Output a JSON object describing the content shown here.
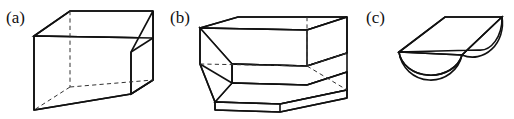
{
  "figure": {
    "background_color": "#ffffff",
    "line_color": "#111111",
    "hidden_line_color": "#333333",
    "panels": [
      {
        "id": "panel-a",
        "label": "(a)",
        "shape_name": "truncated-rectangular-prism",
        "description": "Wedge-shaped box: rectangular prism with the lower-left portion cut away on a slant"
      },
      {
        "id": "panel-b",
        "label": "(b)",
        "shape_name": "two-step-block",
        "description": "Stepped block with two rectangular tiers descending toward the viewer"
      },
      {
        "id": "panel-c",
        "label": "(c)",
        "shape_name": "half-cylinder",
        "description": "Half cylinder lying flat, flat rectangular top face and semicircular end"
      }
    ]
  }
}
